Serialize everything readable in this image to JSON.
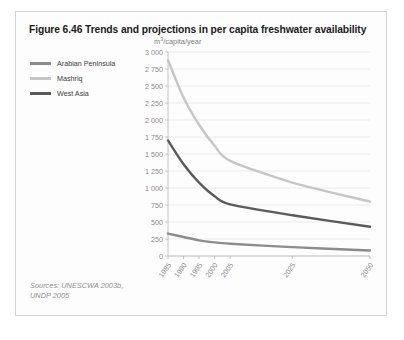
{
  "figure": {
    "title": "Figure 6.46 Trends and projections in per capita freshwater availability",
    "sources_line1": "Sources: UNESCWA 2003b,",
    "sources_line2": "UNDP 2005"
  },
  "legend": {
    "position": "top-left-outside",
    "items": [
      {
        "label": "Arabian Peninsula",
        "color": "#8c8c8c"
      },
      {
        "label": "Mashriq",
        "color": "#c6c6c6"
      },
      {
        "label": "West Asia",
        "color": "#5a5a5a"
      }
    ]
  },
  "colors": {
    "card_border": "#d4d4d4",
    "grid": "#e2e2e2",
    "axis": "#b5b5b5",
    "tick_text": "#8a8a8a",
    "title_text": "#1b1b1b",
    "sources_text": "#8d8d8d"
  },
  "chart_data": {
    "type": "line",
    "title": "Figure 6.46 Trends and projections in per capita freshwater availability",
    "xlabel": "",
    "ylabel": "m3/capita/year",
    "ylabel_display": "m³/capita/year",
    "x": [
      1985,
      1990,
      1995,
      2000,
      2005,
      2025,
      2050
    ],
    "categories": [
      "1985",
      "1990",
      "1995",
      "2000",
      "2005",
      "2025",
      "2050"
    ],
    "xtick_labels": [
      "1985",
      "1990",
      "1995",
      "2000",
      "2005",
      "2025",
      "2050"
    ],
    "ytick_labels": [
      "0",
      "250",
      "500",
      "750",
      "1 000",
      "1 250",
      "1 500",
      "1 750",
      "2 000",
      "2 250",
      "2 500",
      "2 750",
      "3 000"
    ],
    "ytick_values": [
      0,
      250,
      500,
      750,
      1000,
      1250,
      1500,
      1750,
      2000,
      2250,
      2500,
      2750,
      3000
    ],
    "ylim": [
      0,
      3000
    ],
    "xlim": [
      1985,
      2050
    ],
    "grid": true,
    "legend_position": "outside-left",
    "series": [
      {
        "name": "Mashriq",
        "color": "#c6c6c6",
        "values": [
          2880,
          2330,
          1930,
          1620,
          1400,
          1080,
          800
        ]
      },
      {
        "name": "West Asia",
        "color": "#5a5a5a",
        "values": [
          1700,
          1350,
          1080,
          880,
          760,
          600,
          430
        ]
      },
      {
        "name": "Arabian Peninsula",
        "color": "#8c8c8c",
        "values": [
          330,
          280,
          230,
          200,
          180,
          130,
          80
        ]
      }
    ]
  }
}
